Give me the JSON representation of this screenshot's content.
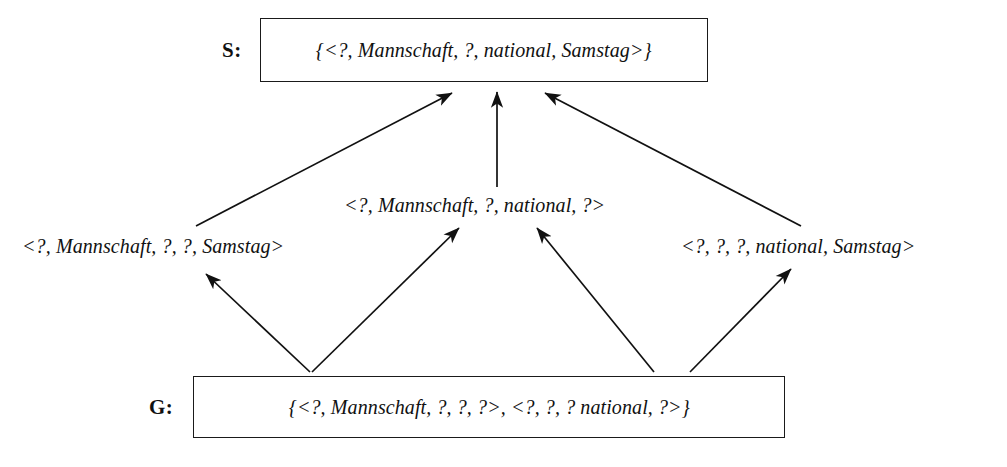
{
  "diagram": {
    "type": "version-space-lattice",
    "ink_color": "#111111",
    "background_color": "#ffffff",
    "specific_boundary": {
      "label": "S:",
      "text": "{<?, Mannschaft, ?, national, Samstag>}"
    },
    "general_boundary": {
      "label": "G:",
      "text": "{<?, Mannschaft, ?, ?, ?>, <?, ?, ? national, ?>}"
    },
    "hypotheses": [
      {
        "id": "left",
        "text": "<?, Mannschaft, ?, ?, Samstag>"
      },
      {
        "id": "middle",
        "text": "<?, Mannschaft, ?, national, ?>"
      },
      {
        "id": "right",
        "text": "<?, ?, ?, national, Samstag>"
      }
    ],
    "edges": [
      {
        "from": "hyp-left",
        "to": "specific-boundary"
      },
      {
        "from": "hyp-middle",
        "to": "specific-boundary"
      },
      {
        "from": "hyp-right",
        "to": "specific-boundary"
      },
      {
        "from": "general-boundary",
        "to": "hyp-left"
      },
      {
        "from": "general-boundary",
        "to": "hyp-middle-left"
      },
      {
        "from": "general-boundary",
        "to": "hyp-middle-right"
      },
      {
        "from": "general-boundary",
        "to": "hyp-right"
      }
    ]
  }
}
